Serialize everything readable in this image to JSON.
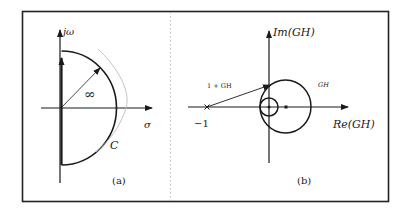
{
  "figure": {
    "panel_a": {
      "caption": "(a)",
      "vertical_axis_label": "jω",
      "horizontal_axis_label": "σ",
      "radius_label": "∞",
      "contour_label": "C"
    },
    "panel_b": {
      "caption": "(b)",
      "vertical_axis_label": "Im(GH)",
      "horizontal_axis_label": "Re(GH)",
      "critical_point_label": "−1",
      "vector_label": "1 + GH",
      "curve_label": "GH"
    }
  }
}
